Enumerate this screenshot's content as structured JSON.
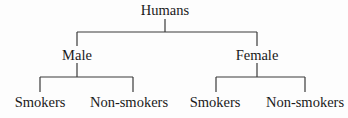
{
  "diagram": {
    "type": "tree",
    "root": {
      "label": "Humans"
    },
    "level1": [
      {
        "label": "Male"
      },
      {
        "label": "Female"
      }
    ],
    "level2": [
      {
        "parent": "Male",
        "label": "Smokers"
      },
      {
        "parent": "Male",
        "label": "Non-smokers"
      },
      {
        "parent": "Female",
        "label": "Smokers"
      },
      {
        "parent": "Female",
        "label": "Non-smokers"
      }
    ],
    "line_color": "#3a3a3a",
    "text_color": "#1a1a1a"
  }
}
